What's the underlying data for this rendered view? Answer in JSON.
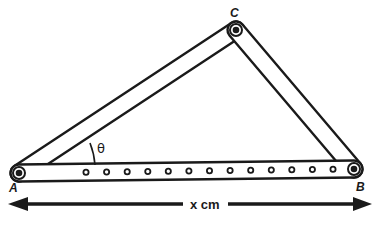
{
  "diagram": {
    "vertices": {
      "A": {
        "label": "A"
      },
      "B": {
        "label": "B"
      },
      "C": {
        "label": "C"
      }
    },
    "angle": {
      "label": "θ",
      "at_vertex": "A"
    },
    "bottom_bar": {
      "hole_count": 13
    },
    "dimension": {
      "label": "x cm",
      "spans": "A to B",
      "arrows": "double-headed"
    },
    "colors": {
      "ink": "#1a1a1a",
      "background": "#ffffff"
    }
  }
}
